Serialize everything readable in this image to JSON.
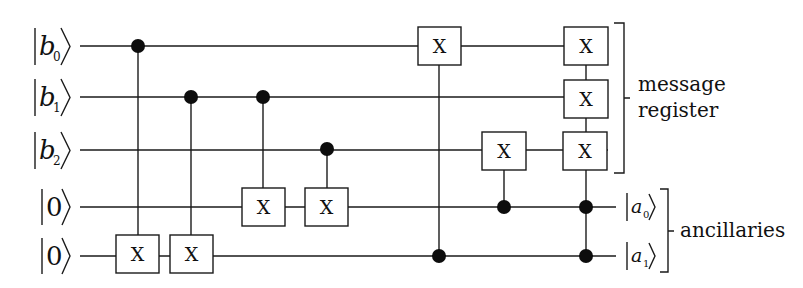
{
  "diagram": {
    "type": "quantum-circuit",
    "gate_label": "X",
    "inputs": [
      {
        "id": "b0",
        "var": "b",
        "sub": "0",
        "y": 46
      },
      {
        "id": "b1",
        "var": "b",
        "sub": "1",
        "y": 97
      },
      {
        "id": "b2",
        "var": "b",
        "sub": "2",
        "y": 150
      },
      {
        "id": "z0",
        "var": "0",
        "sub": "",
        "y": 207
      },
      {
        "id": "z1",
        "var": "0",
        "sub": "",
        "y": 256
      }
    ],
    "outputs": [
      {
        "id": "a0",
        "var": "a",
        "sub": "0",
        "y": 207
      },
      {
        "id": "a1",
        "var": "a",
        "sub": "1",
        "y": 256
      }
    ],
    "gates": [
      {
        "name": "cnot-1",
        "x": 138,
        "controls": [
          0
        ],
        "targets": [
          4
        ]
      },
      {
        "name": "cnot-2",
        "x": 191,
        "controls": [
          1
        ],
        "targets": [
          4
        ]
      },
      {
        "name": "cnot-3",
        "x": 263,
        "controls": [
          1
        ],
        "targets": [
          3
        ]
      },
      {
        "name": "cnot-4",
        "x": 327,
        "controls": [
          2
        ],
        "targets": [
          3
        ]
      },
      {
        "name": "cnot-5",
        "x": 439,
        "controls": [
          4
        ],
        "targets": [
          0
        ]
      },
      {
        "name": "cnot-6",
        "x": 504,
        "controls": [
          3
        ],
        "targets": [
          2
        ]
      },
      {
        "name": "toffoli-multi-x",
        "x": 586,
        "controls": [
          3,
          4
        ],
        "targets": [
          0,
          1,
          2
        ]
      }
    ],
    "groups": [
      {
        "name": "message-register",
        "lines": [
          "message",
          "register"
        ],
        "covers": [
          "b0",
          "b1",
          "b2"
        ]
      },
      {
        "name": "ancillaries",
        "lines": [
          "ancillaries"
        ],
        "covers": [
          "a0",
          "a1"
        ]
      }
    ]
  }
}
